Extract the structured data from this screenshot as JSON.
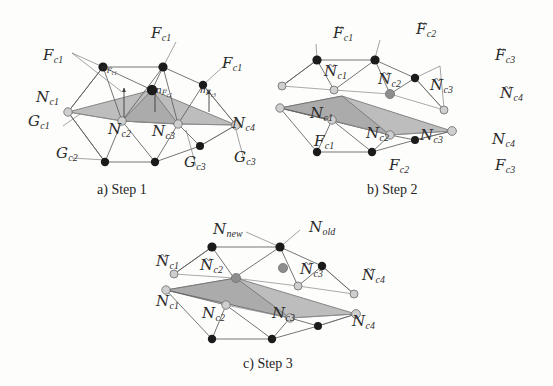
{
  "figure": {
    "background_color": "#fdfdfc",
    "ink_color": "#2b2b2b",
    "face_fill_color": "#b4b4b4",
    "vertex_solid_color": "#1b1b1b",
    "vertex_open_color": "#cfcfcf"
  },
  "panels": [
    {
      "id": "a",
      "caption": "a) Step 1",
      "labels": [
        {
          "id": "a-F-top",
          "base": "F",
          "sub": "c1",
          "tilde": false
        },
        {
          "id": "a-F-left",
          "base": "F",
          "sub": "c1",
          "tilde": false
        },
        {
          "id": "a-F-right",
          "base": "F",
          "sub": "c1",
          "tilde": false
        },
        {
          "id": "a-n-F-c1",
          "base": "n",
          "sub2": "F",
          "sub": "c1",
          "kind": "normal"
        },
        {
          "id": "a-n-F-c2",
          "base": "n",
          "sub2": "F",
          "sub": "c2",
          "kind": "normal"
        },
        {
          "id": "a-n-F-c3",
          "base": "n",
          "sub2": "F",
          "sub": "c3",
          "kind": "normal"
        },
        {
          "id": "a-N-c1",
          "base": "N",
          "sub": "c1",
          "tilde": false
        },
        {
          "id": "a-N-c2",
          "base": "N",
          "sub": "c2",
          "tilde": false
        },
        {
          "id": "a-N-c3",
          "base": "N",
          "sub": "c3",
          "tilde": false
        },
        {
          "id": "a-N-c4",
          "base": "N",
          "sub": "c4",
          "tilde": false
        },
        {
          "id": "a-G-c1",
          "base": "G",
          "sub": "c1",
          "tilde": false
        },
        {
          "id": "a-G-c2",
          "base": "G",
          "sub": "c2",
          "tilde": false
        },
        {
          "id": "a-G-c3",
          "base": "G",
          "sub": "c3",
          "tilde": false
        },
        {
          "id": "a-G-c3b",
          "base": "G",
          "sub": "c3",
          "tilde": false
        }
      ]
    },
    {
      "id": "b",
      "caption": "b) Step 2",
      "labels": [
        {
          "id": "b-Ft-c1",
          "base": "F",
          "sub": "c1",
          "tilde": true
        },
        {
          "id": "b-Ft-c2",
          "base": "F",
          "sub": "c2",
          "tilde": true
        },
        {
          "id": "b-Ft-c3",
          "base": "F",
          "sub": "c3",
          "tilde": true
        },
        {
          "id": "b-Nt-c1",
          "base": "N",
          "sub": "c1",
          "tilde": true
        },
        {
          "id": "b-Nt-c2",
          "base": "N",
          "sub": "c2",
          "tilde": true
        },
        {
          "id": "b-Nt-c3",
          "base": "N",
          "sub": "c3",
          "tilde": true
        },
        {
          "id": "b-Nt-c4",
          "base": "N",
          "sub": "c4",
          "tilde": true
        },
        {
          "id": "b-N-c1",
          "base": "N",
          "sub": "c1",
          "tilde": false
        },
        {
          "id": "b-N-c2",
          "base": "N",
          "sub": "c2",
          "tilde": false
        },
        {
          "id": "b-N-c3",
          "base": "N",
          "sub": "c3",
          "tilde": false
        },
        {
          "id": "b-N-c4",
          "base": "N",
          "sub": "c4",
          "tilde": false
        },
        {
          "id": "b-F-c1",
          "base": "F",
          "sub": "c1",
          "tilde": false
        },
        {
          "id": "b-F-c2",
          "base": "F",
          "sub": "c2",
          "tilde": false
        },
        {
          "id": "b-F-c3",
          "base": "F",
          "sub": "c3",
          "tilde": false
        }
      ]
    },
    {
      "id": "c",
      "caption": "c) Step 3",
      "labels": [
        {
          "id": "c-N-new",
          "base": "N",
          "sub": "new",
          "tilde": false
        },
        {
          "id": "c-N-old",
          "base": "N",
          "sub": "old",
          "tilde": false
        },
        {
          "id": "c-Nt-c1",
          "base": "N",
          "sub": "c1",
          "tilde": true
        },
        {
          "id": "c-Nt-c2",
          "base": "N",
          "sub": "c2",
          "tilde": true
        },
        {
          "id": "c-Nt-c3",
          "base": "N",
          "sub": "c3",
          "tilde": true
        },
        {
          "id": "c-Nt-c4",
          "base": "N",
          "sub": "c4",
          "tilde": true
        },
        {
          "id": "c-N-c1",
          "base": "N",
          "sub": "c1",
          "tilde": false
        },
        {
          "id": "c-N-c2",
          "base": "N",
          "sub": "c2",
          "tilde": false
        },
        {
          "id": "c-N-c3",
          "base": "N",
          "sub": "c3",
          "tilde": false
        },
        {
          "id": "c-N-c4",
          "base": "N",
          "sub": "c4",
          "tilde": false
        }
      ]
    }
  ],
  "text": {
    "a": {
      "caption": "a) Step 1",
      "F_top": "F",
      "F_top_sub": "c1",
      "F_left": "F",
      "F_left_sub": "c1",
      "F_right": "F",
      "F_right_sub": "c1",
      "n1": "n",
      "n1_f": "F",
      "n1_sub": "c1",
      "n2": "n",
      "n2_f": "F",
      "n2_sub": "c2",
      "n3": "n",
      "n3_f": "F",
      "n3_sub": "c3",
      "N1": "N",
      "N1_sub": "c1",
      "N2": "N",
      "N2_sub": "c2",
      "N3": "N",
      "N3_sub": "c3",
      "N4": "N",
      "N4_sub": "c4",
      "G1": "G",
      "G1_sub": "c1",
      "G2": "G",
      "G2_sub": "c2",
      "G3": "G",
      "G3_sub": "c3",
      "G4": "G",
      "G4_sub": "c3"
    },
    "b": {
      "caption": "b) Step 2",
      "Ft1": "F",
      "Ft1_sub": "c1",
      "Ft2": "F",
      "Ft2_sub": "c2",
      "Ft3": "F",
      "Ft3_sub": "c3",
      "Nt1": "N",
      "Nt1_sub": "c1",
      "Nt2": "N",
      "Nt2_sub": "c2",
      "Nt3": "N",
      "Nt3_sub": "c3",
      "Nt4": "N",
      "Nt4_sub": "c4",
      "N1": "N",
      "N1_sub": "c1",
      "N2": "N",
      "N2_sub": "c2",
      "N3": "N",
      "N3_sub": "c3",
      "N4": "N",
      "N4_sub": "c4",
      "F1": "F",
      "F1_sub": "c1",
      "F2": "F",
      "F2_sub": "c2",
      "F3": "F",
      "F3_sub": "c3"
    },
    "c": {
      "caption": "c) Step 3",
      "Nnew": "N",
      "Nnew_sub": "new",
      "Nold": "N",
      "Nold_sub": "old",
      "Nt1": "N",
      "Nt1_sub": "c1",
      "Nt2": "N",
      "Nt2_sub": "c2",
      "Nt3": "N",
      "Nt3_sub": "c3",
      "Nt4": "N",
      "Nt4_sub": "c4",
      "N1": "N",
      "N1_sub": "c1",
      "N2": "N",
      "N2_sub": "c2",
      "N3": "N",
      "N3_sub": "c3",
      "N4": "N",
      "N4_sub": "c4"
    }
  }
}
